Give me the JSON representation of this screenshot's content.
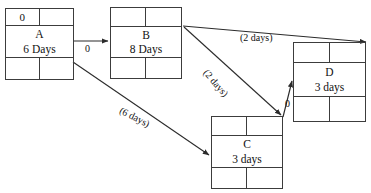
{
  "diagram": {
    "type": "precedence-network-diagram",
    "canvas": {
      "width": 371,
      "height": 193,
      "background": "#ffffff"
    },
    "line_color": "#3c3c3c",
    "nodes": [
      {
        "id": "A",
        "name": "A",
        "duration": "6 Days",
        "top_left": "0",
        "top_right": "",
        "bottom_left": "",
        "bottom_right": ""
      },
      {
        "id": "B",
        "name": "B",
        "duration": "8 Days",
        "top_left": "",
        "top_right": "",
        "bottom_left": "",
        "bottom_right": ""
      },
      {
        "id": "C",
        "name": "C",
        "duration": "3 days",
        "top_left": "",
        "top_right": "",
        "bottom_left": "",
        "bottom_right": ""
      },
      {
        "id": "D",
        "name": "D",
        "duration": "3 days",
        "top_left": "",
        "top_right": "",
        "bottom_left": "",
        "bottom_right": ""
      }
    ],
    "edges": [
      {
        "id": "a-to-b",
        "from": "A",
        "to": "B",
        "label": "0"
      },
      {
        "id": "b-to-d",
        "from": "B",
        "to": "D",
        "label": "(2 days)"
      },
      {
        "id": "b-to-c",
        "from": "B",
        "to": "C",
        "label": "(2 days)"
      },
      {
        "id": "a-to-c",
        "from": "A",
        "to": "C",
        "label": "(6 days)"
      },
      {
        "id": "c-to-d",
        "from": "C",
        "to": "D",
        "label": "0"
      }
    ]
  }
}
